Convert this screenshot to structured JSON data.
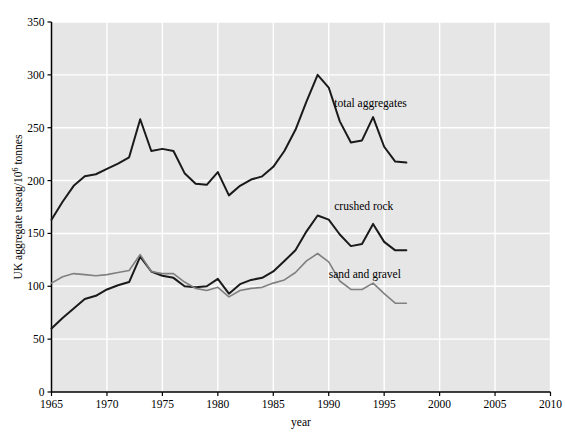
{
  "chart_data": {
    "type": "line",
    "title": "",
    "xlabel": "year",
    "ylabel": "UK aggregate useag/10⁶ tonnes",
    "ylabel_parts": {
      "pre": "UK aggregate useag/10",
      "sup": "6",
      "post": " tonnes"
    },
    "xlim": [
      1965,
      2010
    ],
    "ylim": [
      0,
      350
    ],
    "xticks": [
      1965,
      1970,
      1975,
      1980,
      1985,
      1990,
      1995,
      2000,
      2005,
      2010
    ],
    "xtick_labels": [
      "1965",
      "1970",
      "1975",
      "1980",
      "1985",
      "1990",
      "1995",
      "2000",
      "2005",
      "2010"
    ],
    "yticks": [
      0,
      50,
      100,
      150,
      200,
      250,
      300,
      350
    ],
    "ytick_labels": [
      "0",
      "50",
      "100",
      "150",
      "200",
      "250",
      "300",
      "350"
    ],
    "grid": true,
    "grid_color": "#ffffff",
    "plot_bg_color": "#e6e6e6",
    "legend_position": "inline-annotations",
    "x": [
      1965,
      1966,
      1967,
      1968,
      1969,
      1970,
      1971,
      1972,
      1973,
      1974,
      1975,
      1976,
      1977,
      1978,
      1979,
      1980,
      1981,
      1982,
      1983,
      1984,
      1985,
      1986,
      1987,
      1988,
      1989,
      1990,
      1991,
      1992,
      1993,
      1994,
      1995,
      1996,
      1997
    ],
    "series": [
      {
        "name": "total aggregates",
        "label": "total aggregates",
        "color": "#1a1a1a",
        "width": 2.0,
        "values": [
          163,
          180,
          195,
          204,
          206,
          211,
          216,
          222,
          258,
          228,
          230,
          228,
          207,
          197,
          196,
          208,
          186,
          195,
          201,
          204,
          213,
          228,
          248,
          275,
          300,
          288,
          256,
          236,
          238,
          260,
          232,
          218,
          217
        ]
      },
      {
        "name": "crushed rock",
        "label": "crushed rock",
        "color": "#1a1a1a",
        "width": 2.0,
        "values": [
          60,
          70,
          79,
          88,
          91,
          97,
          101,
          104,
          128,
          114,
          110,
          108,
          100,
          99,
          100,
          107,
          93,
          102,
          106,
          108,
          114,
          124,
          134,
          152,
          167,
          163,
          149,
          138,
          140,
          159,
          142,
          134,
          134
        ]
      },
      {
        "name": "sand and gravel",
        "label": "sand and gravel",
        "color": "#808080",
        "width": 1.6,
        "values": [
          103,
          109,
          112,
          111,
          110,
          111,
          113,
          115,
          130,
          114,
          112,
          112,
          104,
          98,
          96,
          99,
          90,
          96,
          98,
          99,
          103,
          106,
          113,
          124,
          131,
          123,
          105,
          97,
          97,
          103,
          93,
          84,
          84
        ]
      }
    ],
    "annotations": [
      {
        "name": "total-aggregates-annotation",
        "text": "total aggregates",
        "x": 1990.5,
        "y": 270
      },
      {
        "name": "crushed-rock-annotation",
        "text": "crushed rock",
        "x": 1990.5,
        "y": 172
      },
      {
        "name": "sand-and-gravel-annotation",
        "text": "sand and gravel",
        "x": 1990.0,
        "y": 108
      }
    ]
  }
}
